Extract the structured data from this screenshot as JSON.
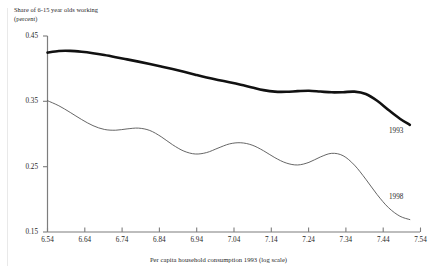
{
  "chart_data": {
    "type": "line",
    "title": "Share of 6-15 year olds working",
    "subtitle": "(percent)",
    "xlabel": "Per capita household consumption 1993 (log scale)",
    "ylabel": "",
    "xlim": [
      6.54,
      7.59
    ],
    "ylim": [
      0.15,
      0.45
    ],
    "grid": false,
    "legend_position": "inline-right",
    "xticks": [
      "6.54",
      "6.64",
      "6.74",
      "6.84",
      "6.94",
      "7.04",
      "7.14",
      "7.24",
      "7.34",
      "7.44",
      "7.54"
    ],
    "xtick_values": [
      6.54,
      6.64,
      6.74,
      6.84,
      6.94,
      7.04,
      7.14,
      7.24,
      7.34,
      7.44,
      7.54
    ],
    "yticks": [
      "0.45",
      "0.35",
      "0.25",
      "0.15"
    ],
    "ytick_values": [
      0.45,
      0.35,
      0.25,
      0.15
    ],
    "series": [
      {
        "name": "1993",
        "label": "1993",
        "color": "#111111",
        "width": 2.6,
        "x": [
          6.54,
          6.572,
          6.604,
          6.636,
          6.668,
          6.7,
          6.732,
          6.764,
          6.796,
          6.828,
          6.86,
          6.892,
          6.924,
          6.956,
          6.988,
          7.02,
          7.052,
          7.084,
          7.116,
          7.148,
          7.18,
          7.212,
          7.244,
          7.276,
          7.308,
          7.34,
          7.372,
          7.404,
          7.436,
          7.468,
          7.5,
          7.532,
          7.56
        ],
        "values": [
          0.4245,
          0.427,
          0.4272,
          0.4258,
          0.4236,
          0.4208,
          0.4176,
          0.4142,
          0.4108,
          0.4072,
          0.4034,
          0.3994,
          0.3952,
          0.3908,
          0.3866,
          0.3828,
          0.3792,
          0.3754,
          0.3712,
          0.3672,
          0.3648,
          0.3646,
          0.3656,
          0.3662,
          0.365,
          0.3638,
          0.364,
          0.3648,
          0.3612,
          0.3508,
          0.3368,
          0.3234,
          0.314
        ]
      },
      {
        "name": "1998",
        "label": "1998",
        "color": "#555555",
        "width": 0.9,
        "x": [
          6.54,
          6.572,
          6.604,
          6.636,
          6.668,
          6.7,
          6.732,
          6.764,
          6.796,
          6.828,
          6.86,
          6.892,
          6.924,
          6.956,
          6.988,
          7.02,
          7.052,
          7.084,
          7.116,
          7.148,
          7.18,
          7.212,
          7.244,
          7.276,
          7.308,
          7.34,
          7.372,
          7.404,
          7.436,
          7.468,
          7.5,
          7.532,
          7.56
        ],
        "values": [
          0.351,
          0.3432,
          0.333,
          0.3222,
          0.3128,
          0.307,
          0.3058,
          0.3078,
          0.309,
          0.3054,
          0.2958,
          0.2836,
          0.2738,
          0.2694,
          0.2716,
          0.2784,
          0.2848,
          0.2866,
          0.283,
          0.2744,
          0.2638,
          0.2556,
          0.2526,
          0.2566,
          0.2648,
          0.2704,
          0.2668,
          0.2524,
          0.2308,
          0.2072,
          0.1872,
          0.1742,
          0.169
        ]
      }
    ],
    "annotations": [
      {
        "text": "1993",
        "x": 7.45,
        "y": 0.345
      },
      {
        "text": "1998",
        "x": 7.45,
        "y": 0.205
      }
    ]
  },
  "axis": {
    "y_label_0": "0.45",
    "y_label_1": "0.35",
    "y_label_2": "0.25",
    "y_label_3": "0.15",
    "x_label_0": "6.54",
    "x_label_1": "6.64",
    "x_label_2": "6.74",
    "x_label_3": "6.84",
    "x_label_4": "6.94",
    "x_label_5": "7.04",
    "x_label_6": "7.14",
    "x_label_7": "7.24",
    "x_label_8": "7.34",
    "x_label_9": "7.44",
    "x_label_10": "7.54"
  },
  "colors": {
    "background": "#ffffff",
    "axis": "#7d7d7d",
    "text": "#1f1f1f",
    "series_1993": "#111111",
    "series_1998": "#555555"
  }
}
